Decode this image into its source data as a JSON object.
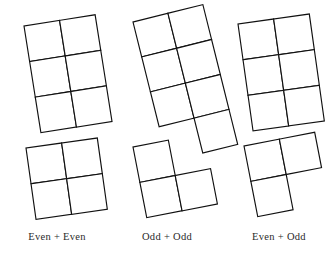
{
  "figure": {
    "background_color": "#ffffff",
    "stroke_color": "#111111",
    "fill_color": "#ffffff",
    "stroke_width": 1.15,
    "cell_size": 36,
    "groups": [
      {
        "id": "even-plus-even",
        "caption": "Even + Even",
        "addend_a": {
          "name": "even-six-block",
          "parity": "even",
          "square_count": 6,
          "columns": 2,
          "rows": 3,
          "cells": [
            [
              0,
              0
            ],
            [
              1,
              0
            ],
            [
              0,
              1
            ],
            [
              1,
              1
            ],
            [
              0,
              2
            ],
            [
              1,
              2
            ]
          ],
          "rotation_deg": -9,
          "origin_x": 24,
          "origin_y": 26
        },
        "addend_b": {
          "name": "even-four-block",
          "parity": "even",
          "square_count": 4,
          "columns": 2,
          "rows": 2,
          "cells": [
            [
              0,
              0
            ],
            [
              1,
              0
            ],
            [
              0,
              1
            ],
            [
              1,
              1
            ]
          ],
          "rotation_deg": -8,
          "origin_x": 26,
          "origin_y": 148
        },
        "sum_parity": "even"
      },
      {
        "id": "odd-plus-odd",
        "caption": "Odd + Odd",
        "addend_a": {
          "name": "odd-seven-block",
          "parity": "odd",
          "square_count": 7,
          "columns": 2,
          "rows": 3,
          "cells": [
            [
              0,
              0
            ],
            [
              1,
              0
            ],
            [
              0,
              1
            ],
            [
              1,
              1
            ],
            [
              0,
              2
            ],
            [
              1,
              2
            ],
            [
              1,
              3
            ]
          ],
          "rotation_deg": -14,
          "origin_x": 133,
          "origin_y": 22
        },
        "addend_b": {
          "name": "odd-three-block",
          "parity": "odd",
          "square_count": 3,
          "columns": 2,
          "rows": 2,
          "cells": [
            [
              0,
              0
            ],
            [
              0,
              1
            ],
            [
              1,
              1
            ]
          ],
          "rotation_deg": -11,
          "origin_x": 133,
          "origin_y": 147
        },
        "sum_parity": "even"
      },
      {
        "id": "even-plus-odd",
        "caption": "Even + Odd",
        "addend_a": {
          "name": "even-six-block-2",
          "parity": "even",
          "square_count": 6,
          "columns": 2,
          "rows": 3,
          "cells": [
            [
              0,
              0
            ],
            [
              1,
              0
            ],
            [
              0,
              1
            ],
            [
              1,
              1
            ],
            [
              0,
              2
            ],
            [
              1,
              2
            ]
          ],
          "rotation_deg": -8,
          "origin_x": 238,
          "origin_y": 24
        },
        "addend_b": {
          "name": "odd-three-block-2",
          "parity": "odd",
          "square_count": 3,
          "columns": 2,
          "rows": 2,
          "cells": [
            [
              0,
              0
            ],
            [
              1,
              0
            ],
            [
              0,
              1
            ]
          ],
          "rotation_deg": -11,
          "origin_x": 244,
          "origin_y": 146
        },
        "sum_parity": "odd"
      }
    ],
    "captions": [
      "Even + Even",
      "Odd + Odd",
      "Even + Odd"
    ]
  }
}
